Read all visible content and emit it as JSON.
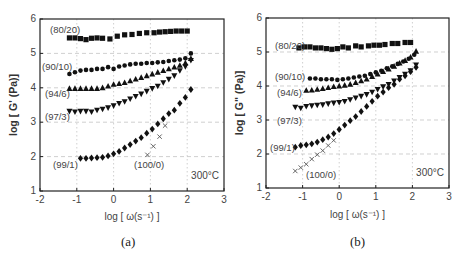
{
  "chart_data": [
    {
      "panel": "(a)",
      "type": "scatter",
      "title": "",
      "xlabel": "log [ ω(s⁻¹) ]",
      "ylabel": "log [ G' (Pa)]",
      "xlim": [
        -2,
        3
      ],
      "ylim": [
        1,
        6
      ],
      "xticks": [
        -2,
        -1,
        0,
        1,
        2,
        3
      ],
      "yticks": [
        1,
        2,
        3,
        4,
        5,
        6
      ],
      "grid": true,
      "annotation": "300°C",
      "series": [
        {
          "name": "(80/20)",
          "marker": "square",
          "x": [
            -1.2,
            -1.05,
            -0.9,
            -0.75,
            -0.6,
            -0.45,
            -0.3,
            -0.1,
            0.1,
            0.3,
            0.5,
            0.7,
            0.9,
            1.1,
            1.25,
            1.4,
            1.55,
            1.7,
            1.85,
            2.0
          ],
          "y": [
            5.45,
            5.45,
            5.43,
            5.4,
            5.44,
            5.45,
            5.44,
            5.42,
            5.5,
            5.54,
            5.55,
            5.58,
            5.6,
            5.6,
            5.62,
            5.63,
            5.64,
            5.65,
            5.65,
            5.65
          ]
        },
        {
          "name": "(90/10)",
          "marker": "circle",
          "x": [
            -1.2,
            -1.05,
            -0.9,
            -0.75,
            -0.6,
            -0.45,
            -0.3,
            -0.15,
            0.0,
            0.15,
            0.3,
            0.45,
            0.6,
            0.75,
            0.9,
            1.05,
            1.2,
            1.35,
            1.5,
            1.65,
            1.8,
            1.95,
            2.1
          ],
          "y": [
            4.4,
            4.45,
            4.5,
            4.52,
            4.52,
            4.55,
            4.55,
            4.6,
            4.55,
            4.62,
            4.65,
            4.68,
            4.7,
            4.7,
            4.72,
            4.72,
            4.74,
            4.75,
            4.78,
            4.8,
            4.82,
            4.86,
            5.0
          ]
        },
        {
          "name": "(94/6)",
          "marker": "triangle-up",
          "x": [
            -1.2,
            -1.05,
            -0.9,
            -0.75,
            -0.6,
            -0.45,
            -0.3,
            -0.15,
            0.0,
            0.15,
            0.3,
            0.45,
            0.6,
            0.75,
            0.9,
            1.05,
            1.2,
            1.35,
            1.5,
            1.65,
            1.8,
            1.95,
            2.1
          ],
          "y": [
            3.98,
            3.98,
            3.98,
            3.98,
            3.98,
            3.98,
            4.0,
            4.05,
            4.1,
            4.12,
            4.15,
            4.2,
            4.25,
            4.3,
            4.35,
            4.4,
            4.45,
            4.5,
            4.55,
            4.6,
            4.65,
            4.72,
            4.85
          ]
        },
        {
          "name": "(97/3)",
          "marker": "triangle-down",
          "x": [
            -1.2,
            -1.05,
            -0.9,
            -0.75,
            -0.6,
            -0.45,
            -0.3,
            -0.15,
            0.0,
            0.15,
            0.3,
            0.45,
            0.6,
            0.75,
            0.9,
            1.05,
            1.2,
            1.35,
            1.5,
            1.65,
            1.8,
            1.95,
            2.1
          ],
          "y": [
            3.32,
            3.3,
            3.32,
            3.32,
            3.3,
            3.35,
            3.38,
            3.42,
            3.48,
            3.55,
            3.6,
            3.68,
            3.75,
            3.82,
            3.9,
            3.98,
            4.05,
            4.15,
            4.25,
            4.35,
            4.5,
            4.62,
            4.8
          ]
        },
        {
          "name": "(99/1)",
          "marker": "diamond",
          "x": [
            -0.9,
            -0.75,
            -0.6,
            -0.45,
            -0.3,
            -0.15,
            0.0,
            0.15,
            0.3,
            0.45,
            0.6,
            0.75,
            0.9,
            1.05,
            1.2,
            1.35,
            1.5,
            1.65,
            1.8,
            1.95,
            2.1
          ],
          "y": [
            1.95,
            1.95,
            1.96,
            1.97,
            1.98,
            2.02,
            2.08,
            2.15,
            2.25,
            2.35,
            2.45,
            2.55,
            2.68,
            2.8,
            2.95,
            3.1,
            3.25,
            3.35,
            3.55,
            3.72,
            3.95
          ]
        },
        {
          "name": "(100/0)",
          "marker": "x",
          "x": [
            0.92,
            1.08,
            1.25,
            1.4
          ],
          "y": [
            2.05,
            2.3,
            2.58,
            2.9
          ]
        }
      ]
    },
    {
      "panel": "(b)",
      "type": "scatter",
      "title": "",
      "xlabel": "log [ ω(s⁻¹) ]",
      "ylabel": "log [ G\" (Pa)]",
      "xlim": [
        -2,
        3
      ],
      "ylim": [
        1,
        6
      ],
      "xticks": [
        -2,
        -1,
        0,
        1,
        2,
        3
      ],
      "yticks": [
        1,
        2,
        3,
        4,
        5,
        6
      ],
      "grid": true,
      "annotation": "300°C",
      "series": [
        {
          "name": "(80/20)",
          "marker": "square",
          "x": [
            -1.1,
            -0.95,
            -0.8,
            -0.65,
            -0.5,
            -0.35,
            -0.2,
            -0.05,
            0.1,
            0.25,
            0.45,
            0.6,
            0.8,
            0.95,
            1.1,
            1.25,
            1.45,
            1.6,
            1.8,
            1.95
          ],
          "y": [
            5.12,
            5.15,
            5.15,
            5.12,
            5.12,
            5.1,
            5.08,
            5.1,
            5.15,
            5.12,
            5.18,
            5.15,
            5.18,
            5.2,
            5.2,
            5.22,
            5.25,
            5.25,
            5.28,
            5.28
          ]
        },
        {
          "name": "(90/10)",
          "marker": "circle",
          "x": [
            -0.8,
            -0.65,
            -0.5,
            -0.35,
            -0.2,
            -0.05,
            0.1,
            0.25,
            0.4,
            0.55,
            0.7,
            0.85,
            1.0,
            1.15,
            1.3,
            1.45,
            1.6,
            1.75,
            1.9,
            2.05
          ],
          "y": [
            4.22,
            4.22,
            4.2,
            4.2,
            4.2,
            4.18,
            4.2,
            4.22,
            4.25,
            4.28,
            4.3,
            4.35,
            4.4,
            4.45,
            4.52,
            4.58,
            4.65,
            4.72,
            4.8,
            4.92
          ]
        },
        {
          "name": "(94/6)",
          "marker": "triangle-up",
          "x": [
            -0.9,
            -0.75,
            -0.6,
            -0.45,
            -0.3,
            -0.15,
            0.0,
            0.15,
            0.3,
            0.45,
            0.6,
            0.75,
            0.9,
            1.05,
            1.2,
            1.35,
            1.5,
            1.65,
            1.8,
            1.95,
            2.1
          ],
          "y": [
            3.87,
            3.88,
            3.9,
            3.92,
            3.95,
            3.98,
            4.0,
            4.02,
            4.05,
            4.1,
            4.15,
            4.2,
            4.28,
            4.35,
            4.42,
            4.5,
            4.58,
            4.67,
            4.75,
            4.85,
            5.02
          ]
        },
        {
          "name": "(97/3)",
          "marker": "triangle-down",
          "x": [
            -1.2,
            -1.05,
            -0.9,
            -0.75,
            -0.6,
            -0.45,
            -0.3,
            -0.15,
            0.0,
            0.15,
            0.3,
            0.45,
            0.6,
            0.75,
            0.9,
            1.05,
            1.2,
            1.35,
            1.5,
            1.65,
            1.8,
            1.95,
            2.1
          ],
          "y": [
            3.38,
            3.35,
            3.4,
            3.42,
            3.44,
            3.45,
            3.48,
            3.5,
            3.52,
            3.55,
            3.6,
            3.65,
            3.7,
            3.75,
            3.82,
            3.9,
            3.98,
            4.05,
            4.15,
            4.25,
            4.35,
            4.45,
            4.62
          ]
        },
        {
          "name": "(99/1)",
          "marker": "diamond",
          "x": [
            -1.2,
            -1.05,
            -0.9,
            -0.75,
            -0.6,
            -0.45,
            -0.3,
            -0.15,
            0.0,
            0.15,
            0.3,
            0.45,
            0.6,
            0.75,
            0.9,
            1.05,
            1.2,
            1.35,
            1.5,
            1.65,
            1.8,
            1.95,
            2.1
          ],
          "y": [
            2.2,
            2.25,
            2.27,
            2.3,
            2.35,
            2.42,
            2.5,
            2.6,
            2.72,
            2.85,
            2.98,
            3.1,
            3.25,
            3.4,
            3.55,
            3.7,
            3.82,
            3.95,
            4.05,
            4.2,
            4.3,
            4.42,
            4.55
          ]
        },
        {
          "name": "(100/0)",
          "marker": "x",
          "x": [
            -1.2,
            -1.05,
            -0.9,
            -0.75,
            -0.6,
            -0.45,
            -0.3,
            -0.15
          ],
          "y": [
            1.5,
            1.6,
            1.7,
            1.85,
            1.98,
            2.1,
            2.25,
            2.4
          ]
        }
      ]
    }
  ],
  "panels": [
    {
      "caption": "(a)",
      "ylabel": "log [ G' (Pa)]",
      "xlabel": "log [ ω(s⁻¹) ]",
      "temperature": "300°C",
      "ytick_labels": [
        "1",
        "2",
        "3",
        "4",
        "5",
        "6"
      ],
      "xtick_labels": [
        "-2",
        "-1",
        "0",
        "1",
        "2",
        "3"
      ],
      "series_labels": [
        {
          "text": "(80/20)",
          "x": 50,
          "y": 33
        },
        {
          "text": "(90/10)",
          "x": 42,
          "y": 70
        },
        {
          "text": "(94/6)",
          "x": 45,
          "y": 97
        },
        {
          "text": "(97/3)",
          "x": 45,
          "y": 120
        },
        {
          "text": "(99/1)",
          "x": 53,
          "y": 168
        },
        {
          "text": "(100/0)",
          "x": 134,
          "y": 168
        }
      ]
    },
    {
      "caption": "(b)",
      "ylabel": "log [ G\" (Pa)]",
      "xlabel": "log [ ω(s⁻¹) ]",
      "temperature": "300°C",
      "ytick_labels": [
        "1",
        "2",
        "3",
        "4",
        "5",
        "6"
      ],
      "xtick_labels": [
        "-2",
        "-1",
        "0",
        "1",
        "2",
        "3"
      ],
      "series_labels": [
        {
          "text": "(80/20)",
          "x": 275,
          "y": 49
        },
        {
          "text": "(90/10)",
          "x": 275,
          "y": 80
        },
        {
          "text": "(94/6)",
          "x": 277,
          "y": 96
        },
        {
          "text": "(97/3)",
          "x": 277,
          "y": 124
        },
        {
          "text": "(99/1)",
          "x": 270,
          "y": 151
        },
        {
          "text": "(100/0)",
          "x": 306,
          "y": 178
        }
      ]
    }
  ]
}
